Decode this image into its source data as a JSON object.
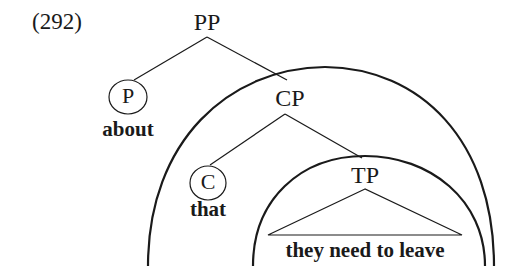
{
  "example_number": "(292)",
  "tree": {
    "root": {
      "label": "PP"
    },
    "p_head": {
      "label": "P",
      "word": "about",
      "circled": true
    },
    "cp": {
      "label": "CP"
    },
    "c_head": {
      "label": "C",
      "word": "that",
      "circled": true
    },
    "tp": {
      "label": "TP",
      "content": "they need to leave",
      "triangle": true
    }
  },
  "arcs": [
    {
      "name": "outer-arc",
      "encloses": "CP"
    },
    {
      "name": "inner-arc",
      "encloses": "TP"
    }
  ],
  "colors": {
    "ink": "#1a1a1a",
    "background": "#ffffff"
  }
}
